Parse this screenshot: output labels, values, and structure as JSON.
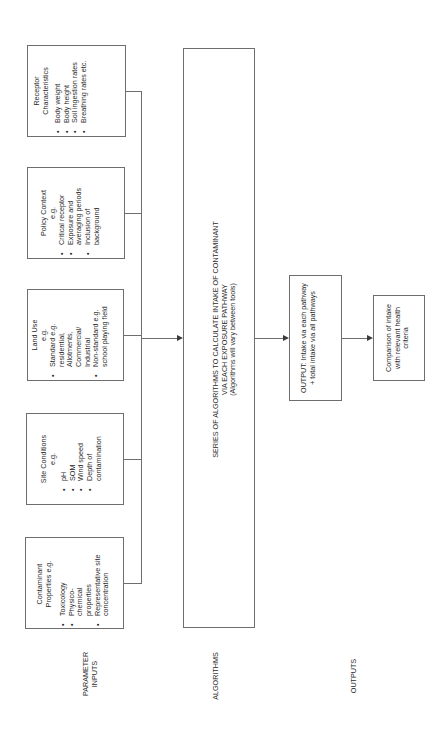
{
  "sections": {
    "inputs_label": [
      "PARAMETER",
      "INPUTS"
    ],
    "algorithms_label": "ALGORITHMS",
    "outputs_label": "OUTPUTS"
  },
  "inputs": [
    {
      "id": "receptor",
      "title": [
        "Receptor",
        "Characteristics"
      ],
      "items": [
        "Body weight",
        "Body height",
        "Soil ingestion rates",
        "Breathing rates etc."
      ]
    },
    {
      "id": "policy",
      "title": [
        "Policy Context",
        "e.g."
      ],
      "items": [
        "Critical receptor",
        "Exposure and averaging periods",
        "Inclusion of background"
      ]
    },
    {
      "id": "landuse",
      "title": [
        "Land Use",
        "e.g."
      ],
      "items": [
        "Standard e.g. residential, Allotments, Commercial/ Industrial",
        "Non-standard e.g. school playing field"
      ]
    },
    {
      "id": "site",
      "title": [
        "Site Conditions",
        "e.g."
      ],
      "items": [
        "pH",
        "SOM",
        "Wind speed",
        "Depth of contamination"
      ]
    },
    {
      "id": "contaminant",
      "title": [
        "Contaminant",
        "Properties e.g."
      ],
      "items": [
        "Toxicology",
        "Physico-chemical properties",
        "Representative site concentration"
      ]
    }
  ],
  "algorithms_box": {
    "line1": "SERIES OF ALGORITHMS TO CALCULATE INTAKE OF CONTAMINANT",
    "line2": "VIA EACH EXPOSURE PATHWAY",
    "line3": "(Algorithms will vary between tools)"
  },
  "output_box": {
    "text": "OUTPUT: Intake via each pathway + total intake via all pathways"
  },
  "comparison_box": {
    "text": "Comparison of intake with relevant health criteria"
  },
  "bullet": "•",
  "colors": {
    "stroke": "#6e6e6e",
    "text": "#2a2a2a",
    "background": "#ffffff"
  }
}
